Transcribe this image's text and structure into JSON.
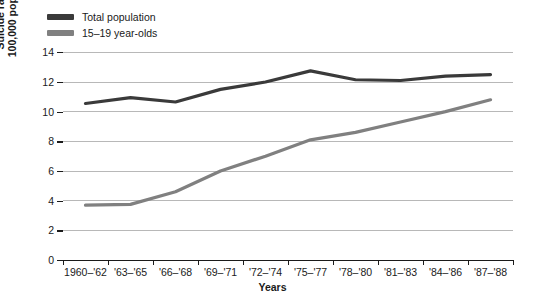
{
  "legend": {
    "position": "top-left",
    "items": [
      {
        "label": "Total population",
        "color": "#3a3a3a",
        "swatch_name": "legend-swatch-total-population"
      },
      {
        "label": "15–19 year-olds",
        "color": "#808080",
        "swatch_name": "legend-swatch-teens"
      }
    ]
  },
  "axes": {
    "ylabel_line1": "Suicide rate per",
    "ylabel_line2": "100,000 population",
    "xlabel": "Years",
    "yticks": [
      "0",
      "2",
      "4",
      "6",
      "8",
      "10",
      "12",
      "14"
    ],
    "xticks": [
      "1960–'62",
      "'63–'65",
      "'66–'68",
      "'69–'71",
      "'72–'74",
      "'75–'77",
      "'78–'80",
      "'81–'83",
      "'84–'86",
      "'87–'88"
    ]
  },
  "chart_data": {
    "type": "line",
    "title": "",
    "xlabel": "Years",
    "ylabel": "Suicide rate per 100,000 population",
    "categories": [
      "1960–'62",
      "'63–'65",
      "'66–'68",
      "'69–'71",
      "'72–'74",
      "'75–'77",
      "'78–'80",
      "'81–'83",
      "'84–'86",
      "'87–'88"
    ],
    "series": [
      {
        "name": "Total population",
        "color": "#3a3a3a",
        "values": [
          10.55,
          10.95,
          10.65,
          11.5,
          12.0,
          12.75,
          12.15,
          12.1,
          12.4,
          12.5
        ]
      },
      {
        "name": "15–19 year-olds",
        "color": "#808080",
        "values": [
          3.7,
          3.75,
          4.6,
          6.0,
          7.0,
          8.1,
          8.6,
          9.3,
          10.0,
          10.8
        ]
      }
    ],
    "ylim": [
      0,
      14
    ],
    "ytick_values": [
      0,
      2,
      4,
      6,
      8,
      10,
      12,
      14
    ],
    "grid": "horizontal",
    "legend_position": "top-left"
  }
}
